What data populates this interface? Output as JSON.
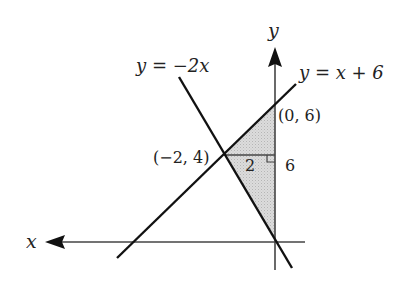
{
  "diagram": {
    "type": "coordinate-geometry",
    "axes": {
      "x_label": "x",
      "y_label": "y",
      "x_arrow_direction": "left",
      "y_arrow_direction": "up"
    },
    "lines": [
      {
        "id": "line-1",
        "equation_label": "y = −2x"
      },
      {
        "id": "line-2",
        "equation_label": "y = x + 6"
      }
    ],
    "points": [
      {
        "label": "(0, 6)",
        "x": 0,
        "y": 6
      },
      {
        "label": "(−2, 4)",
        "x": -2,
        "y": 4
      }
    ],
    "shaded_region": {
      "description": "Triangle with vertices (0,0), (−2,4), (0,6)",
      "vertices": [
        [
          0,
          0
        ],
        [
          -2,
          4
        ],
        [
          0,
          6
        ]
      ],
      "fill": "#d6d6d6"
    },
    "annotations": {
      "base_length": "2",
      "height_length": "6",
      "right_angle_marker": true
    },
    "colors": {
      "line": "#111111",
      "axis": "#444444",
      "shade": "#d6d6d6",
      "text": "#222222"
    }
  }
}
